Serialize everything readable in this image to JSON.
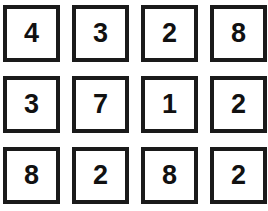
{
  "page": {
    "background_color": "#ffffff",
    "border_color": "#1a1a1a",
    "digit_color": "#111111",
    "cell_fill_color": "#ffffff"
  },
  "grid": {
    "rows": 3,
    "columns": 4,
    "cell_size_px": 57,
    "border_width_px": 4,
    "gap_x_px": 12,
    "gap_y_px": 14,
    "cells": [
      [
        {
          "value": "4"
        },
        {
          "value": "3"
        },
        {
          "value": "2"
        },
        {
          "value": "8"
        }
      ],
      [
        {
          "value": "3"
        },
        {
          "value": "7"
        },
        {
          "value": "1"
        },
        {
          "value": "2"
        }
      ],
      [
        {
          "value": "8"
        },
        {
          "value": "2"
        },
        {
          "value": "8"
        },
        {
          "value": "2"
        }
      ]
    ]
  }
}
